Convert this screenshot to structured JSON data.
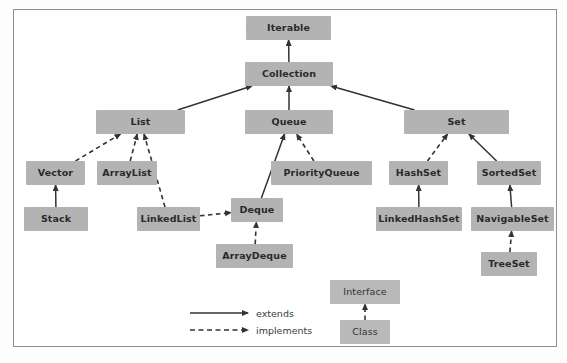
{
  "diagram": {
    "background_color": "#ffffff",
    "frame_color": "#8e9194",
    "node_fill_color": "#b3b3b3",
    "node_text_color": "#2a2a2a",
    "edge_color": "#333333"
  },
  "nodes": [
    {
      "id": "iterable",
      "label": "Iterable",
      "x": 246,
      "y": 16,
      "w": 85,
      "h": 24,
      "kind": "interface"
    },
    {
      "id": "collection",
      "label": "Collection",
      "x": 245,
      "y": 62,
      "w": 88,
      "h": 24,
      "kind": "interface"
    },
    {
      "id": "list",
      "label": "List",
      "x": 96,
      "y": 110,
      "w": 89,
      "h": 24,
      "kind": "interface"
    },
    {
      "id": "queue",
      "label": "Queue",
      "x": 245,
      "y": 110,
      "w": 88,
      "h": 24,
      "kind": "interface"
    },
    {
      "id": "set",
      "label": "Set",
      "x": 404,
      "y": 110,
      "w": 105,
      "h": 24,
      "kind": "interface"
    },
    {
      "id": "vector",
      "label": "Vector",
      "x": 26,
      "y": 161,
      "w": 59,
      "h": 24,
      "kind": "class"
    },
    {
      "id": "arraylist",
      "label": "ArrayList",
      "x": 97,
      "y": 161,
      "w": 60,
      "h": 24,
      "kind": "class"
    },
    {
      "id": "priorityqueue",
      "label": "PriorityQueue",
      "x": 271,
      "y": 161,
      "w": 101,
      "h": 24,
      "kind": "class"
    },
    {
      "id": "hashset",
      "label": "HashSet",
      "x": 389,
      "y": 161,
      "w": 59,
      "h": 24,
      "kind": "class"
    },
    {
      "id": "sortedset",
      "label": "SortedSet",
      "x": 477,
      "y": 161,
      "w": 64,
      "h": 24,
      "kind": "interface"
    },
    {
      "id": "stack",
      "label": "Stack",
      "x": 24,
      "y": 207,
      "w": 64,
      "h": 24,
      "kind": "class"
    },
    {
      "id": "linkedlist",
      "label": "LinkedList",
      "x": 137,
      "y": 207,
      "w": 63,
      "h": 24,
      "kind": "class"
    },
    {
      "id": "deque",
      "label": "Deque",
      "x": 231,
      "y": 198,
      "w": 52,
      "h": 24,
      "kind": "interface"
    },
    {
      "id": "linkedhashset",
      "label": "LinkedHashSet",
      "x": 376,
      "y": 207,
      "w": 86,
      "h": 24,
      "kind": "class"
    },
    {
      "id": "navigableset",
      "label": "NavigableSet",
      "x": 471,
      "y": 207,
      "w": 83,
      "h": 24,
      "kind": "interface"
    },
    {
      "id": "arraydeque",
      "label": "ArrayDeque",
      "x": 216,
      "y": 244,
      "w": 77,
      "h": 24,
      "kind": "class"
    },
    {
      "id": "treeset",
      "label": "TreeSet",
      "x": 481,
      "y": 252,
      "w": 56,
      "h": 24,
      "kind": "class"
    },
    {
      "id": "interface_key",
      "label": "Interface",
      "x": 330,
      "y": 280,
      "w": 70,
      "h": 24,
      "kind": "legend"
    },
    {
      "id": "class_key",
      "label": "Class",
      "x": 340,
      "y": 320,
      "w": 50,
      "h": 24,
      "kind": "legend"
    }
  ],
  "edges": [
    {
      "from": "collection",
      "to": "iterable",
      "type": "extends"
    },
    {
      "from": "list",
      "to": "collection",
      "type": "extends"
    },
    {
      "from": "queue",
      "to": "collection",
      "type": "extends"
    },
    {
      "from": "set",
      "to": "collection",
      "type": "extends"
    },
    {
      "from": "vector",
      "to": "list",
      "type": "implements"
    },
    {
      "from": "arraylist",
      "to": "list",
      "type": "implements"
    },
    {
      "from": "linkedlist",
      "to": "list",
      "type": "implements"
    },
    {
      "from": "stack",
      "to": "vector",
      "type": "extends"
    },
    {
      "from": "deque",
      "to": "queue",
      "type": "extends"
    },
    {
      "from": "priorityqueue",
      "to": "queue",
      "type": "implements"
    },
    {
      "from": "linkedlist",
      "to": "deque",
      "type": "implements"
    },
    {
      "from": "arraydeque",
      "to": "deque",
      "type": "implements"
    },
    {
      "from": "hashset",
      "to": "set",
      "type": "implements"
    },
    {
      "from": "sortedset",
      "to": "set",
      "type": "extends"
    },
    {
      "from": "linkedhashset",
      "to": "hashset",
      "type": "extends"
    },
    {
      "from": "navigableset",
      "to": "sortedset",
      "type": "extends"
    },
    {
      "from": "treeset",
      "to": "navigableset",
      "type": "implements"
    },
    {
      "from": "class_key",
      "to": "interface_key",
      "type": "implements"
    }
  ],
  "legend": {
    "extends_label": "extends",
    "implements_label": "implements",
    "extends_line": {
      "x1": 190,
      "y1": 313,
      "x2": 248,
      "y2": 313
    },
    "implements_line": {
      "x1": 190,
      "y1": 330,
      "x2": 248,
      "y2": 330
    },
    "extends_label_pos": {
      "x": 256,
      "y": 308
    },
    "implements_label_pos": {
      "x": 256,
      "y": 325
    }
  }
}
